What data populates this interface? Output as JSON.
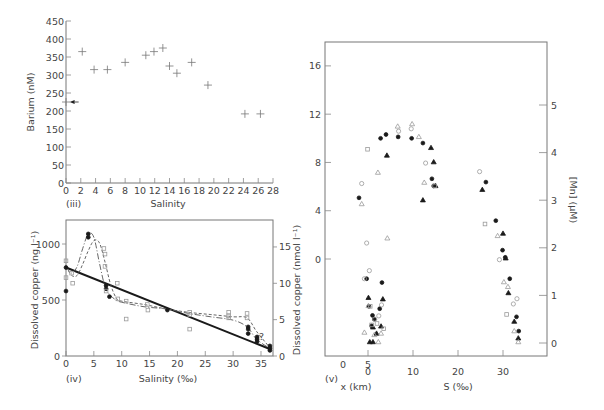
{
  "chart_data": [
    {
      "id": "iii",
      "type": "scatter",
      "panel_label": "(iii)",
      "title": "",
      "xlabel": "Salinity",
      "ylabel": "Barium (nM)",
      "xlim": [
        0,
        28
      ],
      "ylim": [
        0,
        450
      ],
      "xticks": [
        0,
        2,
        4,
        6,
        8,
        10,
        12,
        14,
        16,
        18,
        20,
        22,
        24,
        26,
        28
      ],
      "yticks": [
        0,
        50,
        100,
        150,
        200,
        250,
        300,
        350,
        400,
        450
      ],
      "grid": false,
      "marker": "plus",
      "series": [
        {
          "name": "Barium",
          "points": [
            [
              0,
              225
            ],
            [
              2.2,
              365
            ],
            [
              3.8,
              315
            ],
            [
              5.6,
              315
            ],
            [
              8.0,
              335
            ],
            [
              10.8,
              355
            ],
            [
              11.9,
              365
            ],
            [
              13.1,
              375
            ],
            [
              14.0,
              325
            ],
            [
              15.0,
              305
            ],
            [
              17.0,
              335
            ],
            [
              19.2,
              272
            ],
            [
              24.2,
              192
            ],
            [
              26.3,
              192
            ]
          ]
        }
      ],
      "annotations": [
        {
          "type": "arrow-left",
          "x": 0.9,
          "y": 225
        }
      ]
    },
    {
      "id": "iv",
      "type": "line",
      "panel_label": "(iv)",
      "title": "",
      "xlabel": "Salinity (‰)",
      "ylabel": "Dissolved copper (ng l⁻¹)",
      "ylabel_right": "Dissolved copper (nmol l⁻¹)",
      "xlim": [
        0,
        37
      ],
      "ylim": [
        0,
        1210
      ],
      "ylim_right": [
        0,
        18.7
      ],
      "xticks": [
        0,
        5,
        10,
        15,
        20,
        25,
        30,
        35
      ],
      "yticks": [
        0,
        500,
        1000
      ],
      "yticks_right": [
        0,
        5,
        10,
        15
      ],
      "grid": false,
      "legend": "none",
      "series": [
        {
          "name": "Theoretical dilution line",
          "style": "solid-thick",
          "x": [
            0,
            36.7
          ],
          "y": [
            790,
            60
          ]
        },
        {
          "name": "Survey A (long dash)",
          "style": "long-dash",
          "x": [
            0,
            1,
            2,
            3,
            4,
            5,
            6,
            7,
            8,
            9,
            10,
            14,
            18,
            22,
            26,
            30,
            32.5,
            34.2,
            36.5
          ],
          "y": [
            800,
            740,
            800,
            960,
            1090,
            1060,
            830,
            620,
            540,
            500,
            480,
            440,
            420,
            380,
            350,
            320,
            260,
            150,
            70
          ]
        },
        {
          "name": "Survey B (short dash)",
          "style": "short-dash",
          "x": [
            0,
            1,
            2,
            3,
            4,
            5,
            6,
            7,
            8,
            9,
            10,
            14,
            18,
            22,
            26,
            30,
            32.5,
            34.2,
            36.5
          ],
          "y": [
            800,
            720,
            720,
            820,
            940,
            1030,
            1010,
            840,
            640,
            520,
            490,
            460,
            420,
            390,
            370,
            350,
            340,
            220,
            80
          ]
        },
        {
          "name": "Filled points",
          "style": "marker-filled-circle",
          "points": [
            [
              0,
              790
            ],
            [
              0,
              580
            ],
            [
              4,
              1090
            ],
            [
              4,
              1060
            ],
            [
              7.2,
              630
            ],
            [
              7.2,
              600
            ],
            [
              7.8,
              530
            ],
            [
              18.2,
              410
            ],
            [
              32.7,
              260
            ],
            [
              32.7,
              240
            ],
            [
              32.7,
              200
            ],
            [
              34.3,
              170
            ],
            [
              34.3,
              150
            ],
            [
              34.3,
              130
            ],
            [
              36.6,
              90
            ],
            [
              36.6,
              70
            ],
            [
              36.6,
              50
            ]
          ]
        },
        {
          "name": "Open points",
          "style": "marker-open-square",
          "points": [
            [
              0,
              850
            ],
            [
              0,
              700
            ],
            [
              1,
              740
            ],
            [
              1.2,
              650
            ],
            [
              6.8,
              960
            ],
            [
              7,
              910
            ],
            [
              7,
              800
            ],
            [
              7.2,
              580
            ],
            [
              9.2,
              650
            ],
            [
              9.3,
              510
            ],
            [
              10.8,
              330
            ],
            [
              10.8,
              490
            ],
            [
              14.6,
              460
            ],
            [
              14.7,
              410
            ],
            [
              22.2,
              390
            ],
            [
              22.2,
              370
            ],
            [
              22.2,
              240
            ],
            [
              29.2,
              390
            ],
            [
              29.2,
              360
            ],
            [
              29.2,
              340
            ],
            [
              32.5,
              380
            ],
            [
              32.5,
              340
            ]
          ]
        }
      ],
      "annotations": [
        {
          "type": "text",
          "text": "?",
          "x": 35.2,
          "y": 150
        }
      ]
    },
    {
      "id": "v",
      "type": "scatter",
      "panel_label": "(v)",
      "title": "",
      "xlabel": "S (‰)",
      "xlabel_secondary": "x (km)",
      "ylabel": "Dissolved copper (nmol l⁻¹)",
      "ylabel_right": "[Mn] (µM)",
      "xlim": [
        -5.5,
        39.5
      ],
      "ylim": [
        -8,
        18
      ],
      "ylim_right": [
        -0.27,
        6.33
      ],
      "xticks": [
        0,
        10,
        20,
        30
      ],
      "xticks_secondary_km": [
        0,
        5
      ],
      "yticks": [
        0,
        4,
        8,
        12,
        16
      ],
      "yticks_right": [
        0,
        1,
        2,
        3,
        4,
        5
      ],
      "grid": false,
      "legend": "none",
      "series_axis": "right",
      "series": [
        {
          "name": "Filled circles",
          "marker": "filled-circle",
          "points": [
            [
              -0.3,
              1.35
            ],
            [
              0.2,
              0.77
            ],
            [
              1.0,
              0.58
            ],
            [
              1.4,
              0.5
            ],
            [
              0.8,
              0.36
            ],
            [
              3.1,
              1.27
            ],
            [
              2.6,
              0.72
            ],
            [
              -2.0,
              3.05
            ],
            [
              2.8,
              4.3
            ],
            [
              4.0,
              4.38
            ],
            [
              6.7,
              4.33
            ],
            [
              9.7,
              4.3
            ],
            [
              12.2,
              4.2
            ],
            [
              14.2,
              3.45
            ],
            [
              14.6,
              3.3
            ],
            [
              26.2,
              3.38
            ],
            [
              28.4,
              2.57
            ],
            [
              29.9,
              1.95
            ],
            [
              30.5,
              1.8
            ],
            [
              31.5,
              1.35
            ],
            [
              33.0,
              0.55
            ],
            [
              33.5,
              0.25
            ]
          ]
        },
        {
          "name": "Filled triangles",
          "marker": "filled-triangle",
          "points": [
            [
              0.1,
              0.95
            ],
            [
              0.4,
              0.02
            ],
            [
              1.1,
              0.02
            ],
            [
              1.9,
              0.2
            ],
            [
              3.3,
              0.92
            ],
            [
              2.9,
              0.35
            ],
            [
              1.1,
              0.33
            ],
            [
              4.2,
              3.94
            ],
            [
              12.2,
              3.0
            ],
            [
              14.0,
              4.1
            ],
            [
              14.6,
              3.8
            ],
            [
              15.0,
              3.3
            ],
            [
              25.4,
              3.22
            ],
            [
              30.0,
              2.3
            ],
            [
              30.6,
              1.78
            ],
            [
              31.2,
              1.05
            ],
            [
              32.5,
              0.45
            ],
            [
              33.4,
              0.1
            ]
          ]
        },
        {
          "name": "Open circles",
          "marker": "open-circle",
          "points": [
            [
              -0.3,
              2.1
            ],
            [
              -0.8,
              1.35
            ],
            [
              0.3,
              1.52
            ],
            [
              3.0,
              0.8
            ],
            [
              1.5,
              0.5
            ],
            [
              2.4,
              0.57
            ],
            [
              -1.4,
              3.35
            ],
            [
              6.8,
              4.45
            ],
            [
              9.6,
              4.5
            ],
            [
              12.8,
              3.78
            ],
            [
              24.8,
              3.6
            ],
            [
              29.2,
              1.75
            ],
            [
              33.1,
              0.93
            ],
            [
              32.3,
              0.82
            ]
          ]
        },
        {
          "name": "Open triangles",
          "marker": "open-triangle",
          "points": [
            [
              -0.8,
              0.22
            ],
            [
              0.1,
              0.78
            ],
            [
              1.4,
              0.17
            ],
            [
              2.3,
              0.02
            ],
            [
              2.9,
              0.2
            ],
            [
              4.3,
              2.2
            ],
            [
              -1.4,
              2.92
            ],
            [
              2.2,
              3.58
            ],
            [
              6.6,
              4.55
            ],
            [
              9.8,
              4.6
            ],
            [
              11.3,
              4.33
            ],
            [
              12.5,
              3.37
            ],
            [
              28.8,
              2.25
            ],
            [
              30.2,
              1.28
            ],
            [
              31.1,
              1.18
            ],
            [
              32.5,
              0.25
            ],
            [
              33.4,
              0.02
            ]
          ]
        },
        {
          "name": "Open squares",
          "marker": "open-square",
          "points": [
            [
              2.0,
              0.41
            ],
            [
              3.5,
              0.3
            ],
            [
              0.8,
              0.38
            ],
            [
              0.5,
              0.77
            ],
            [
              -0.1,
              4.07
            ],
            [
              14.8,
              3.3
            ],
            [
              26.0,
              2.5
            ],
            [
              30.8,
              0.6
            ]
          ]
        }
      ]
    }
  ],
  "panels": {
    "iii": {
      "label": "(iii)",
      "xlabel": "Salinity",
      "ylabel": "Barium (nM)"
    },
    "iv": {
      "label": "(iv)",
      "xlabel": "Salinity (‰)",
      "ylabel": "Dissolved copper (ng l⁻¹)",
      "ylabel_right": "Dissolved copper (nmol l⁻¹)",
      "question_mark": "?"
    },
    "v": {
      "label": "(v)",
      "xlabel_km": "x (km)",
      "xlabel_s": "S (‰)",
      "ylabel_right": "[Mn] (µM)"
    }
  },
  "colors": {
    "axis": "#777777",
    "text": "#444444",
    "filled_marker": "#1a1a1a",
    "open_marker": "#9a9a9a",
    "dilution_line": "#1a1a1a",
    "dash_line": "#555555"
  }
}
